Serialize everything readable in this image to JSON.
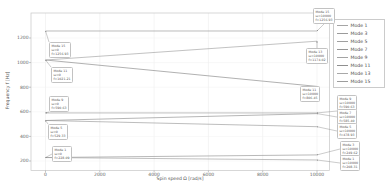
{
  "figure": {
    "background": "#ffffff",
    "frame_color": "#c6c6c6",
    "grid_color": "#e9e9e9",
    "tick_color": "#9e9e9e"
  },
  "chart_data": {
    "type": "line",
    "title": "",
    "xlabel": "Spin speed Ω [rad/s]",
    "ylabel": "Frequency f [Hz]",
    "x": [
      0,
      10000
    ],
    "xticks": [
      0,
      2000,
      4000,
      6000,
      8000,
      10000
    ],
    "yticks": [
      200,
      400,
      600,
      800,
      1000,
      1200
    ],
    "xlim": [
      -530,
      10460
    ],
    "ylim": [
      123,
      1400
    ],
    "grid": true,
    "legend_position": "right-outside",
    "series": [
      {
        "name": "Mode 1",
        "color": "#a5a5a5",
        "values": [
          228.09,
          208.31
        ]
      },
      {
        "name": "Mode 3",
        "color": "#9b9b9b",
        "values": [
          228.09,
          249.62
        ]
      },
      {
        "name": "Mode 5",
        "color": "#a0a0a0",
        "values": [
          529.33,
          478.93
        ]
      },
      {
        "name": "Mode 7",
        "color": "#969696",
        "values": [
          529.33,
          585.4
        ]
      },
      {
        "name": "Mode 9",
        "color": "#a3a3a3",
        "values": [
          590.63,
          590.63
        ]
      },
      {
        "name": "Mode 11",
        "color": "#8f8f8f",
        "values": [
          1021.21,
          806.45
        ]
      },
      {
        "name": "Mode 13",
        "color": "#a8a8a8",
        "values": [
          1021.21,
          1174.02
        ]
      },
      {
        "name": "Mode 15",
        "color": "#9d9d9d",
        "values": [
          1256.93,
          1256.93
        ]
      }
    ],
    "annotations": [
      {
        "mode": "Mode 15",
        "omega": "ω=0",
        "freq": "f=1256.93",
        "tx": 0,
        "tf": 1256.93,
        "bx": 49,
        "by": 42
      },
      {
        "mode": "Mode 11",
        "omega": "ω=0",
        "freq": "f=1021.21",
        "tx": 0,
        "tf": 1021.21,
        "bx": 51,
        "by": 67
      },
      {
        "mode": "Mode 9",
        "omega": "ω=0",
        "freq": "f=590.63",
        "tx": 0,
        "tf": 590.63,
        "bx": 49,
        "by": 96
      },
      {
        "mode": "Mode 5",
        "omega": "ω=0",
        "freq": "f=529.33",
        "tx": 0,
        "tf": 529.33,
        "bx": 48,
        "by": 124
      },
      {
        "mode": "Mode 1",
        "omega": "ω=0",
        "freq": "f=228.09",
        "tx": 0,
        "tf": 228.09,
        "bx": 52,
        "by": 146
      },
      {
        "mode": "Mode 15",
        "omega": "ω=10000",
        "freq": "f=1256.93",
        "tx": 10000,
        "tf": 1256.93,
        "bx": 313,
        "by": 8
      },
      {
        "mode": "Mode 13",
        "omega": "ω=10000",
        "freq": "f=1174.02",
        "tx": 10000,
        "tf": 1174.02,
        "bx": 306,
        "by": 48
      },
      {
        "mode": "Mode 11",
        "omega": "ω=10000",
        "freq": "f=806.45",
        "tx": 10000,
        "tf": 806.45,
        "bx": 300,
        "by": 86
      },
      {
        "mode": "Mode 9",
        "omega": "ω=10000",
        "freq": "f=590.63",
        "tx": 10000,
        "tf": 590.63,
        "bx": 337,
        "by": 95
      },
      {
        "mode": "Mode 7",
        "omega": "ω=10000",
        "freq": "f=585.40",
        "tx": 10000,
        "tf": 585.4,
        "bx": 337,
        "by": 109
      },
      {
        "mode": "Mode 5",
        "omega": "ω=10000",
        "freq": "f=478.93",
        "tx": 10000,
        "tf": 478.93,
        "bx": 337,
        "by": 123
      },
      {
        "mode": "Mode 3",
        "omega": "ω=10000",
        "freq": "f=249.62",
        "tx": 10000,
        "tf": 249.62,
        "bx": 340,
        "by": 141
      },
      {
        "mode": "Mode 1",
        "omega": "ω=10000",
        "freq": "f=208.31",
        "tx": 10000,
        "tf": 208.31,
        "bx": 340,
        "by": 155
      }
    ]
  },
  "legend": {
    "entries": [
      "Mode 1",
      "Mode 3",
      "Mode 5",
      "Mode 7",
      "Mode 9",
      "Mode 11",
      "Mode 13",
      "Mode 15"
    ]
  }
}
